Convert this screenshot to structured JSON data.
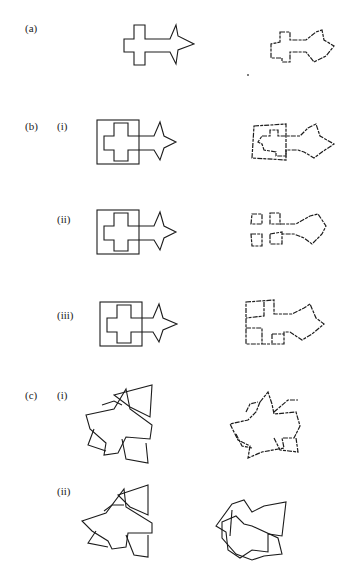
{
  "panels": {
    "a": {
      "label": "(a)"
    },
    "b": {
      "label": "(b)",
      "sub": [
        {
          "label": "(i)"
        },
        {
          "label": "(ii)"
        },
        {
          "label": "(iii)"
        }
      ]
    },
    "c": {
      "label": "(c)",
      "sub": [
        {
          "label": "(i)"
        },
        {
          "label": "(ii)"
        }
      ]
    }
  },
  "figure_items": [
    {
      "panel": "a",
      "left": "arrow-cross-shape",
      "right": "reconstructed-arrow-cross-shape"
    },
    {
      "panel": "b.i",
      "left": "arrow-cross-in-square",
      "right": "reconstructed-arrow-cross-in-square"
    },
    {
      "panel": "b.ii",
      "left": "arrow-cross-in-square",
      "right": "fragmented-reconstruction"
    },
    {
      "panel": "b.iii",
      "left": "arrow-cross-in-square",
      "right": "partitioned-reconstruction"
    },
    {
      "panel": "c.i",
      "left": "rotated-overlapping-shapes",
      "right": "reconstructed-rotated-shapes"
    },
    {
      "panel": "c.ii",
      "left": "rotated-overlapping-shapes",
      "right": "reconstructed-rotated-shapes"
    }
  ],
  "caption": {
    "text": ""
  },
  "colors": {
    "ink": "#1c1c1c",
    "background": "#ffffff"
  }
}
